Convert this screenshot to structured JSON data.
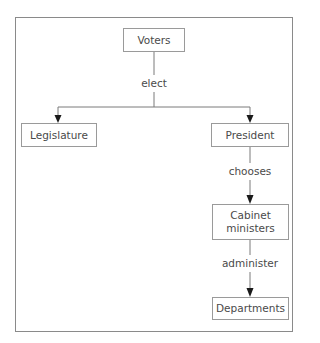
{
  "diagram": {
    "type": "flowchart",
    "nodes": {
      "voters": "Voters",
      "legislature": "Legislature",
      "president": "President",
      "cabinet_line1": "Cabinet",
      "cabinet_line2": "ministers",
      "departments": "Departments"
    },
    "edges": {
      "elect": "elect",
      "chooses": "chooses",
      "administer": "administer"
    },
    "relationships": [
      {
        "from": "Voters",
        "to": "Legislature",
        "label": "elect"
      },
      {
        "from": "Voters",
        "to": "President",
        "label": "elect"
      },
      {
        "from": "President",
        "to": "Cabinet ministers",
        "label": "chooses"
      },
      {
        "from": "Cabinet ministers",
        "to": "Departments",
        "label": "administer"
      }
    ],
    "colors": {
      "border": "#9a9a9a",
      "line": "#7a7a7a",
      "arrow": "#1a1a1a",
      "text": "#4a4a4a"
    }
  }
}
